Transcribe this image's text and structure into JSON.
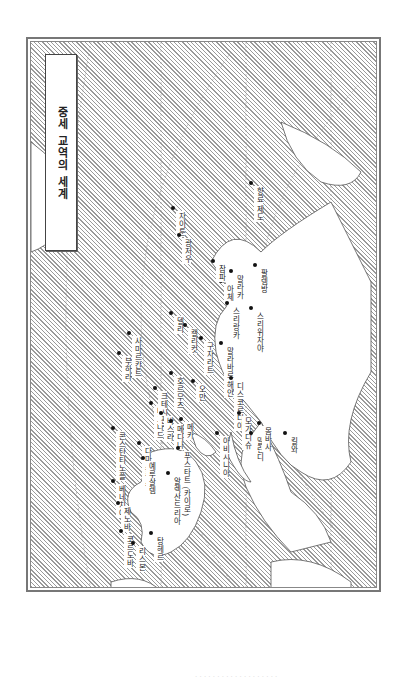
{
  "map": {
    "title": "중세 교역의 세계",
    "orientation": "rotated 90° clockwise",
    "colors": {
      "land_hatch": "#9a9a9a",
      "sea": "#ffffff",
      "border": "#777777",
      "text": "#222222"
    },
    "places": [
      {
        "name": "자이툰",
        "x": 170,
        "y": 205
      },
      {
        "name": "광저우",
        "x": 176,
        "y": 232
      },
      {
        "name": "향료 제도",
        "x": 248,
        "y": 180
      },
      {
        "name": "말라카",
        "x": 228,
        "y": 268
      },
      {
        "name": "팔렘방",
        "x": 252,
        "y": 262
      },
      {
        "name": "아체",
        "x": 218,
        "y": 278
      },
      {
        "name": "스리위자야",
        "x": 248,
        "y": 305
      },
      {
        "name": "참파",
        "x": 210,
        "y": 258
      },
      {
        "name": "스리랑카",
        "x": 224,
        "y": 300
      },
      {
        "name": "델리",
        "x": 168,
        "y": 310
      },
      {
        "name": "캘리컷",
        "x": 182,
        "y": 322
      },
      {
        "name": "구자라트",
        "x": 198,
        "y": 335
      },
      {
        "name": "말라바르 해안",
        "x": 218,
        "y": 340
      },
      {
        "name": "호르무즈",
        "x": 168,
        "y": 370
      },
      {
        "name": "오만",
        "x": 190,
        "y": 378
      },
      {
        "name": "디스코르디아",
        "x": 228,
        "y": 375
      },
      {
        "name": "부하라",
        "x": 116,
        "y": 350
      },
      {
        "name": "사마르칸트",
        "x": 126,
        "y": 330
      },
      {
        "name": "바그다드",
        "x": 148,
        "y": 400
      },
      {
        "name": "크테시폰",
        "x": 152,
        "y": 385
      },
      {
        "name": "바스라",
        "x": 158,
        "y": 410
      },
      {
        "name": "메디나",
        "x": 168,
        "y": 418
      },
      {
        "name": "메카",
        "x": 178,
        "y": 416
      },
      {
        "name": "아비시니아",
        "x": 214,
        "y": 430
      },
      {
        "name": "모가디슈",
        "x": 236,
        "y": 410
      },
      {
        "name": "말린디",
        "x": 248,
        "y": 430
      },
      {
        "name": "몸바사",
        "x": 256,
        "y": 420
      },
      {
        "name": "킬와",
        "x": 282,
        "y": 430
      },
      {
        "name": "콘스탄티노플",
        "x": 110,
        "y": 425
      },
      {
        "name": "다마스쿠스",
        "x": 136,
        "y": 440
      },
      {
        "name": "예루살렘",
        "x": 140,
        "y": 455
      },
      {
        "name": "푸스타트 (카이로)",
        "x": 175,
        "y": 445
      },
      {
        "name": "알렉산드리아",
        "x": 165,
        "y": 470
      },
      {
        "name": "베네치아",
        "x": 110,
        "y": 478
      },
      {
        "name": "제노바",
        "x": 115,
        "y": 500
      },
      {
        "name": "코르도바",
        "x": 118,
        "y": 528
      },
      {
        "name": "리스본",
        "x": 130,
        "y": 540
      },
      {
        "name": "탕헤르",
        "x": 148,
        "y": 530
      }
    ]
  },
  "footer": {
    "text": "· · · · · · · · · · · · · · · · · · ·"
  }
}
